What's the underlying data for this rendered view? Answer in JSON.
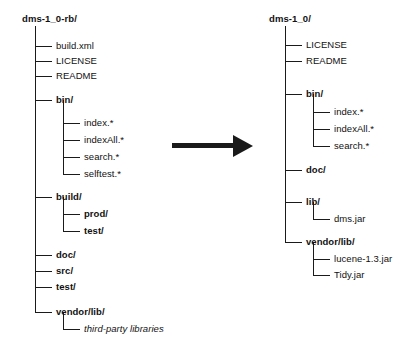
{
  "diagram": {
    "type": "tree-comparison",
    "line_color": "#1a1a1a",
    "background_color": "#ffffff"
  },
  "arrow": {
    "name": "transformation-arrow",
    "direction": "right",
    "color": "#1a1a1a"
  },
  "left_tree": {
    "root": "dms-1_0-rb/",
    "nodes": [
      {
        "label": "build.xml",
        "kind": "file",
        "level": 1,
        "last": false
      },
      {
        "label": "LICENSE",
        "kind": "file",
        "level": 1,
        "last": false
      },
      {
        "label": "README",
        "kind": "file",
        "level": 1,
        "last": false
      },
      {
        "label": "bin/",
        "kind": "dir",
        "level": 1,
        "last": false
      },
      {
        "label": "index.*",
        "kind": "file",
        "level": 2,
        "last": false
      },
      {
        "label": "indexAll.*",
        "kind": "file",
        "level": 2,
        "last": false
      },
      {
        "label": "search.*",
        "kind": "file",
        "level": 2,
        "last": false
      },
      {
        "label": "selftest.*",
        "kind": "file",
        "level": 2,
        "last": true
      },
      {
        "label": "build/",
        "kind": "dir",
        "level": 1,
        "last": false
      },
      {
        "label": "prod/",
        "kind": "dir",
        "level": 2,
        "last": false
      },
      {
        "label": "test/",
        "kind": "dir",
        "level": 2,
        "last": true
      },
      {
        "label": "doc/",
        "kind": "dir",
        "level": 1,
        "last": false
      },
      {
        "label": "src/",
        "kind": "dir",
        "level": 1,
        "last": false
      },
      {
        "label": "test/",
        "kind": "dir",
        "level": 1,
        "last": false
      },
      {
        "label": "vendor/lib/",
        "kind": "dir",
        "level": 1,
        "last": true
      },
      {
        "label": "third-party libraries",
        "kind": "note",
        "level": 2,
        "last": true
      }
    ]
  },
  "right_tree": {
    "root": "dms-1_0/",
    "nodes": [
      {
        "label": "LICENSE",
        "kind": "file",
        "level": 1,
        "last": false
      },
      {
        "label": "README",
        "kind": "file",
        "level": 1,
        "last": false
      },
      {
        "label": "bin/",
        "kind": "dir",
        "level": 1,
        "last": false
      },
      {
        "label": "index.*",
        "kind": "file",
        "level": 2,
        "last": false
      },
      {
        "label": "indexAll.*",
        "kind": "file",
        "level": 2,
        "last": false
      },
      {
        "label": "search.*",
        "kind": "file",
        "level": 2,
        "last": true
      },
      {
        "label": "doc/",
        "kind": "dir",
        "level": 1,
        "last": false
      },
      {
        "label": "lib/",
        "kind": "dir",
        "level": 1,
        "last": false
      },
      {
        "label": "dms.jar",
        "kind": "file",
        "level": 2,
        "last": true
      },
      {
        "label": "vendor/lib/",
        "kind": "dir",
        "level": 1,
        "last": true
      },
      {
        "label": "lucene-1.3.jar",
        "kind": "file",
        "level": 2,
        "last": false
      },
      {
        "label": "Tidy.jar",
        "kind": "file",
        "level": 2,
        "last": true
      }
    ]
  },
  "layout": {
    "left": {
      "root_x": 22,
      "root_y": 13,
      "spine_x": 35,
      "spine_top": 26,
      "indent": 28,
      "stub_len": 17,
      "text_gap": 4,
      "rows_y": [
        46,
        61,
        76,
        100,
        123,
        140,
        157,
        174,
        197,
        214,
        231,
        255,
        271,
        287,
        312,
        329
      ]
    },
    "right": {
      "root_x": 269,
      "root_y": 13,
      "spine_x": 285,
      "spine_top": 26,
      "indent": 28,
      "stub_len": 17,
      "text_gap": 4,
      "rows_y": [
        45,
        61,
        94,
        112,
        129,
        146,
        170,
        202,
        219,
        242,
        259,
        275
      ]
    },
    "arrow": {
      "x": 172,
      "y": 143,
      "shaft_len": 62,
      "shaft_h": 5
    }
  }
}
